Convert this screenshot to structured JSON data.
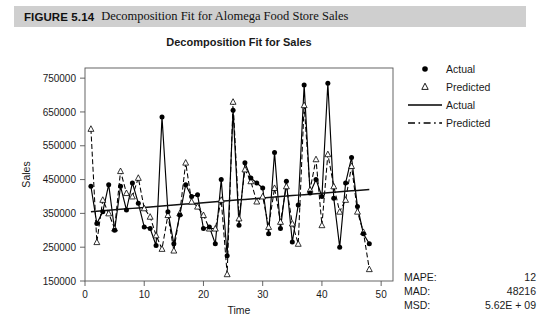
{
  "figure": {
    "number": "FIGURE 5.14",
    "caption": "Decomposition Fit for Alomega Food Store Sales"
  },
  "legend": {
    "items": [
      {
        "label": "Actual",
        "key": "filled-circle-marker"
      },
      {
        "label": "Predicted",
        "key": "open-triangle-marker"
      },
      {
        "label": "Actual",
        "key": "solid-line"
      },
      {
        "label": "Predicted",
        "key": "dashed-line"
      }
    ]
  },
  "stats": {
    "title": "Accuracy Measures",
    "rows": [
      {
        "name": "MAPE:",
        "value": "12"
      },
      {
        "name": "MAD:",
        "value": "48216"
      },
      {
        "name": "MSD:",
        "value": "5.62E + 09"
      }
    ]
  },
  "chart_data": {
    "type": "line",
    "title": "Decomposition Fit for Sales",
    "xlabel": "Time",
    "ylabel": "Sales",
    "xlim": [
      0,
      52
    ],
    "ylim": [
      150000,
      780000
    ],
    "xticks": [
      0,
      10,
      20,
      30,
      40,
      50
    ],
    "yticks": [
      150000,
      250000,
      350000,
      450000,
      550000,
      650000,
      750000
    ],
    "grid": false,
    "legend_position": "right",
    "x": [
      1,
      2,
      3,
      4,
      5,
      6,
      7,
      8,
      9,
      10,
      11,
      12,
      13,
      14,
      15,
      16,
      17,
      18,
      19,
      20,
      21,
      22,
      23,
      24,
      25,
      26,
      27,
      28,
      29,
      30,
      31,
      32,
      33,
      34,
      35,
      36,
      37,
      38,
      39,
      40,
      41,
      42,
      43,
      44,
      45,
      46,
      47,
      48
    ],
    "series": [
      {
        "name": "Actual",
        "marker": "filled-circle",
        "line": "solid",
        "values": [
          430000,
          320000,
          355000,
          435000,
          300000,
          430000,
          360000,
          440000,
          380000,
          310000,
          305000,
          255000,
          635000,
          355000,
          260000,
          345000,
          435000,
          400000,
          405000,
          305000,
          310000,
          260000,
          450000,
          225000,
          655000,
          315000,
          500000,
          455000,
          440000,
          425000,
          290000,
          530000,
          305000,
          445000,
          265000,
          375000,
          730000,
          410000,
          450000,
          400000,
          735000,
          395000,
          250000,
          440000,
          515000,
          370000,
          290000,
          260000
        ]
      },
      {
        "name": "Predicted",
        "marker": "open-triangle",
        "line": "dashed",
        "values": [
          600000,
          265000,
          390000,
          350000,
          305000,
          475000,
          410000,
          400000,
          455000,
          365000,
          340000,
          285000,
          245000,
          345000,
          240000,
          350000,
          500000,
          385000,
          370000,
          345000,
          305000,
          305000,
          390000,
          170000,
          680000,
          335000,
          480000,
          445000,
          385000,
          400000,
          310000,
          425000,
          325000,
          430000,
          320000,
          260000,
          670000,
          420000,
          510000,
          315000,
          525000,
          430000,
          355000,
          390000,
          490000,
          355000,
          295000,
          185000
        ]
      },
      {
        "name": "Trend",
        "marker": "none",
        "line": "solid",
        "values": [
          355000,
          356400,
          357800,
          359200,
          360600,
          362000,
          363400,
          364800,
          366200,
          367600,
          369000,
          370400,
          371800,
          373200,
          374600,
          376000,
          377400,
          378800,
          380200,
          381600,
          383000,
          384400,
          385800,
          387200,
          388600,
          390000,
          391400,
          392800,
          394200,
          395600,
          397000,
          398400,
          399800,
          401200,
          402600,
          404000,
          405400,
          406800,
          408200,
          409600,
          411000,
          412400,
          413800,
          415200,
          416600,
          418000,
          419400,
          420800
        ]
      }
    ]
  }
}
